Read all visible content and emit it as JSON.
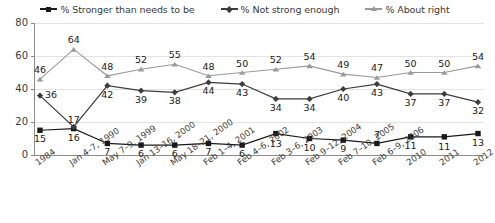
{
  "legend": {
    "entries": [
      {
        "label": "% Stronger than needs to be",
        "marker": "square-marker-icon",
        "color": "#1a1a1a"
      },
      {
        "label": "% Not strong enough",
        "marker": "diamond-marker-icon",
        "color": "#3d3d3d"
      },
      {
        "label": "% About right",
        "marker": "triangle-marker-icon",
        "color": "#9a9a9a"
      }
    ]
  },
  "axes": {
    "y_ticks": [
      "0",
      "20",
      "40",
      "60",
      "80"
    ],
    "x_ticks": [
      "1984",
      "Jan 4–7, 1990",
      "May 7–9, 1999",
      "Jan 13–16, 2000",
      "May 18–21, 2000",
      "Feb 1–4, 2001",
      "Feb 4–6, 2002",
      "Feb 3–6, 2003",
      "Feb 9–12, 2004",
      "Feb 7–10, 2005",
      "Feb 6–9, 2006",
      "2010",
      "2011",
      "2012"
    ]
  },
  "chart_data": {
    "type": "line",
    "title": "",
    "xlabel": "",
    "ylabel": "",
    "ylim": [
      0,
      80
    ],
    "yticks": [
      0,
      20,
      40,
      60,
      80
    ],
    "grid": true,
    "legend_position": "top",
    "categories": [
      "1984",
      "Jan 4–7, 1990",
      "May 7–9, 1999",
      "Jan 13–16, 2000",
      "May 18–21, 2000",
      "Feb 1–4, 2001",
      "Feb 4–6, 2002",
      "Feb 3–6, 2003",
      "Feb 9–12, 2004",
      "Feb 7–10, 2005",
      "Feb 6–9, 2006",
      "2010",
      "2011",
      "2012"
    ],
    "series": [
      {
        "name": "% Stronger than needs to be",
        "marker": "square",
        "color": "#1a1a1a",
        "label_side": "below",
        "values": [
          15,
          16,
          7,
          6,
          6,
          7,
          6,
          13,
          10,
          9,
          7,
          11,
          11,
          13
        ]
      },
      {
        "name": "% Not strong enough",
        "marker": "diamond",
        "color": "#3d3d3d",
        "label_side": "below",
        "values": [
          36,
          17,
          42,
          39,
          38,
          44,
          43,
          34,
          34,
          40,
          43,
          37,
          37,
          32
        ]
      },
      {
        "name": "% About right",
        "marker": "triangle",
        "color": "#9a9a9a",
        "label_side": "above",
        "values": [
          46,
          64,
          48,
          52,
          55,
          48,
          50,
          52,
          54,
          49,
          47,
          50,
          50,
          54
        ]
      }
    ]
  }
}
